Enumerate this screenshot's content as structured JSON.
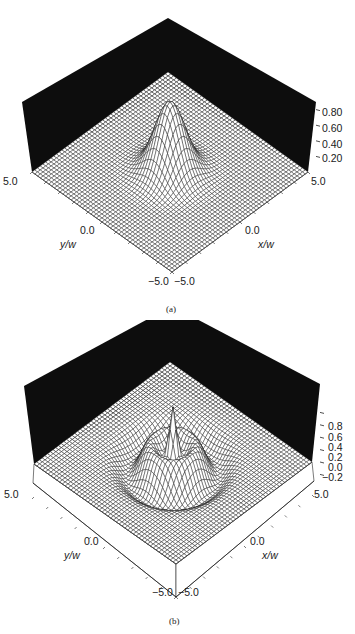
{
  "figure": {
    "panels": [
      {
        "id": "a",
        "caption": "(a)",
        "z_ticks": [
          "0.80",
          "0.60",
          "0.40",
          "0.20"
        ],
        "x_axis": {
          "title": "x/w",
          "min_label": "−5.0",
          "mid_label": "0.0",
          "max_label": "5.0"
        },
        "y_axis": {
          "title": "y/w",
          "min_label": "−5.0",
          "mid_label": "0.0",
          "max_label": "5.0"
        }
      },
      {
        "id": "b",
        "caption": "(b)",
        "z_ticks": [
          "0.8",
          "0.6",
          "0.4",
          "0.2",
          "0.0",
          "−0.2"
        ],
        "x_axis": {
          "title": "x/w",
          "min_label": "−5.0",
          "mid_label": "0.0",
          "max_label": "5.0"
        },
        "y_axis": {
          "title": "y/w",
          "min_label": "−5.0",
          "mid_label": "0.0",
          "max_label": "5.0"
        }
      }
    ]
  },
  "colors": {
    "wall": "#0d0d0d",
    "mesh": "#1a1a1a",
    "surface": "#ffffff",
    "background": "#ffffff"
  },
  "chart_data": [
    {
      "type": "surface3d",
      "title": "(a)",
      "xlabel": "x/w",
      "ylabel": "y/w",
      "zlabel": "",
      "xlim": [
        -5.0,
        5.0
      ],
      "ylim": [
        -5.0,
        5.0
      ],
      "zlim": [
        0.0,
        0.9
      ],
      "x_ticks": [
        -5.0,
        0.0,
        5.0
      ],
      "y_ticks": [
        -5.0,
        0.0,
        5.0
      ],
      "z_ticks": [
        0.2,
        0.4,
        0.6,
        0.8
      ],
      "description": "Single Gaussian-like peak centered at origin, max ~0.9",
      "function": "gaussian",
      "peak": 0.9,
      "width": 1.0,
      "grid_resolution": 50
    },
    {
      "type": "surface3d",
      "title": "(b)",
      "xlabel": "x/w",
      "ylabel": "y/w",
      "zlabel": "",
      "xlim": [
        -5.0,
        5.0
      ],
      "ylim": [
        -5.0,
        5.0
      ],
      "zlim": [
        -0.3,
        0.9
      ],
      "x_ticks": [
        -5.0,
        0.0,
        5.0
      ],
      "y_ticks": [
        -5.0,
        0.0,
        5.0
      ],
      "z_ticks": [
        -0.2,
        0.0,
        0.2,
        0.4,
        0.6,
        0.8
      ],
      "description": "Central narrow peak (~0.9) surrounded by ring with negative trough; oscillatory (Laguerre-Gauss-like) profile",
      "function": "ring",
      "peak": 0.9,
      "width": 1.0,
      "grid_resolution": 50
    }
  ]
}
